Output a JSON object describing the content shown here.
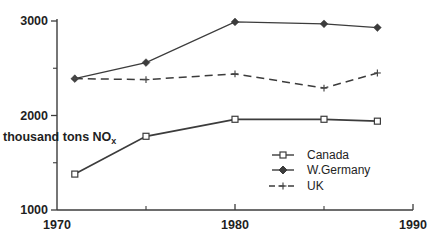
{
  "chart_data": {
    "type": "line",
    "title": "",
    "xlabel": "",
    "ylabel": "thousand tons NO",
    "ylabel_sub": "x",
    "x": [
      1971,
      1975,
      1980,
      1985,
      1988
    ],
    "series": [
      {
        "name": "Canada",
        "marker": "square-hollow",
        "line_style": "solid",
        "values": [
          1380,
          1780,
          1960,
          1960,
          1940
        ]
      },
      {
        "name": "W.Germany",
        "marker": "diamond-filled",
        "line_style": "solid",
        "values": [
          2390,
          2560,
          2990,
          2970,
          2930
        ]
      },
      {
        "name": "UK",
        "marker": "plus",
        "line_style": "dashed",
        "values": [
          2390,
          2380,
          2440,
          2290,
          2450
        ]
      }
    ],
    "xlim": [
      1970,
      1990
    ],
    "ylim": [
      1000,
      3000
    ],
    "x_tick_labels": [
      "1970",
      "1980",
      "1990"
    ],
    "x_ticks_major": [
      1980,
      1990
    ],
    "x_ticks_minor": [
      1975,
      1985
    ],
    "y_tick_labels": [
      "1000",
      "2000",
      "3000"
    ],
    "y_ticks_major": [
      1000,
      2000,
      3000
    ],
    "y_ticks_minor": [
      1500,
      2500
    ],
    "grid": false,
    "legend_position": "inside-lower-right",
    "colors": {
      "line": "#3c3c3c",
      "text": "#1f1f1f",
      "background": "#ffffff"
    }
  }
}
